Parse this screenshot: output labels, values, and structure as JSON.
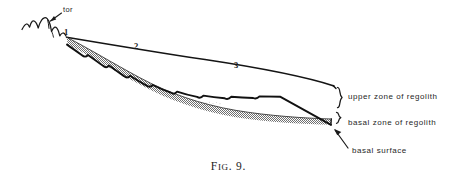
{
  "figure": {
    "caption_prefix": "F",
    "caption_smallcaps": "IG",
    "caption_number": ". 9.",
    "caption_full": "FIG. 9."
  },
  "annotations": {
    "tor": "tor",
    "slope_segment_1": "1",
    "slope_segment_2": "2",
    "slope_segment_3": "3",
    "upper_zone": "upper zone of regolith",
    "basal_zone": "basal  zone of regolith",
    "basal_surface": "basal surface"
  },
  "colors": {
    "ink": "#1a1a1a",
    "stipple_fill": "#9a9a9a",
    "background": "#ffffff",
    "paper_tint": "#fdfdfd"
  },
  "diagram": {
    "type": "geological-cross-section",
    "elements": [
      "tor outcrop silhouette",
      "ground surface line",
      "upper zone of regolith (unshaded)",
      "basal zone of regolith (stippled band)",
      "basal surface (scalloped lower boundary)"
    ]
  }
}
